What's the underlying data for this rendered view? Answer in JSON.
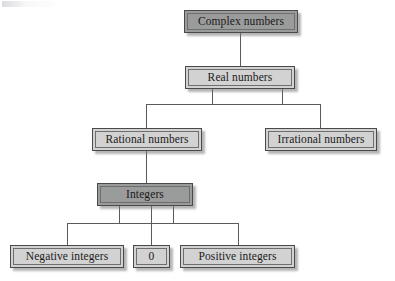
{
  "diagram": {
    "type": "hierarchy-tree",
    "colors": {
      "highlight_fill": "#9a9b9b",
      "normal_fill": "#d2d2d2",
      "border": "#4a4a4a",
      "line": "#5a5a5a",
      "background": "#ffffff"
    },
    "nodes": {
      "complex": {
        "label": "Complex numbers",
        "level": 1,
        "emphasis": "dark"
      },
      "real": {
        "label": "Real numbers",
        "level": 2,
        "emphasis": "light"
      },
      "rational": {
        "label": "Rational numbers",
        "level": 3,
        "emphasis": "light"
      },
      "irrational": {
        "label": "Irrational numbers",
        "level": 3,
        "emphasis": "light"
      },
      "integers": {
        "label": "Integers",
        "level": 4,
        "emphasis": "dark"
      },
      "negative": {
        "label": "Negative integers",
        "level": 5,
        "emphasis": "light"
      },
      "zero": {
        "label": "0",
        "level": 5,
        "emphasis": "light"
      },
      "positive": {
        "label": "Positive integers",
        "level": 5,
        "emphasis": "light"
      }
    },
    "edges": [
      {
        "from": "complex",
        "to": "real"
      },
      {
        "from": "real",
        "to": "rational"
      },
      {
        "from": "real",
        "to": "irrational"
      },
      {
        "from": "rational",
        "to": "integers"
      },
      {
        "from": "integers",
        "to": "negative"
      },
      {
        "from": "integers",
        "to": "zero"
      },
      {
        "from": "integers",
        "to": "positive"
      }
    ]
  }
}
